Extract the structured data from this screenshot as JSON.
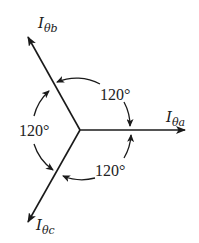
{
  "diagram": {
    "type": "three-phase phasor diagram",
    "phasors": [
      {
        "id": "a",
        "symbol": "I",
        "subscript": "θa",
        "angle_deg": 0
      },
      {
        "id": "b",
        "symbol": "I",
        "subscript": "θb",
        "angle_deg": 120
      },
      {
        "id": "c",
        "symbol": "I",
        "subscript": "θc",
        "angle_deg": 240
      }
    ],
    "angle_labels": [
      {
        "between": "a-b",
        "text": "120°"
      },
      {
        "between": "b-c",
        "text": "120°"
      },
      {
        "between": "c-a",
        "text": "120°"
      }
    ],
    "colors": {
      "ink": "#1a1a1a",
      "background": "#ffffff"
    }
  }
}
